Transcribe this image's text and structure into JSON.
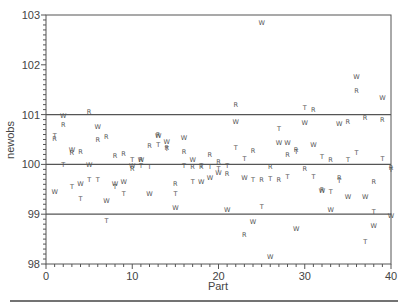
{
  "chart_data": {
    "type": "scatter",
    "title": "",
    "xlabel": "Part",
    "ylabel": "newobs",
    "xlim": [
      0,
      40
    ],
    "ylim": [
      98,
      103
    ],
    "x_ticks": [
      0,
      10,
      20,
      30,
      40
    ],
    "y_ticks": [
      98,
      99,
      100,
      101,
      102,
      103
    ],
    "reference_lines": [
      {
        "y": 101,
        "label": "upper limit"
      },
      {
        "y": 100,
        "label": "center"
      },
      {
        "y": 99,
        "label": "lower limit"
      }
    ],
    "grid": false,
    "legend": null,
    "marker_labels": [
      "R",
      "T",
      "W"
    ],
    "series": [
      {
        "name": "R",
        "points": [
          [
            1,
            100.52
          ],
          [
            2,
            100.8
          ],
          [
            3,
            100.23
          ],
          [
            4,
            100.25
          ],
          [
            5,
            101.06
          ],
          [
            6,
            100.5
          ],
          [
            7,
            100.57
          ],
          [
            8,
            100.18
          ],
          [
            9,
            100.21
          ],
          [
            10,
            99.92
          ],
          [
            11,
            100.1
          ],
          [
            12,
            100.37
          ],
          [
            13,
            100.6
          ],
          [
            14,
            100.34
          ],
          [
            15,
            99.62
          ],
          [
            16,
            100.26
          ],
          [
            17,
            99.96
          ],
          [
            18,
            99.96
          ],
          [
            19,
            100.19
          ],
          [
            20,
            100.05
          ],
          [
            21,
            99.82
          ],
          [
            22,
            101.2
          ],
          [
            23,
            98.6
          ],
          [
            24,
            100.27
          ],
          [
            25,
            99.7
          ],
          [
            26,
            99.96
          ],
          [
            27,
            99.7
          ],
          [
            28,
            100.2
          ],
          [
            29,
            100.3
          ],
          [
            30,
            99.92
          ],
          [
            31,
            101.1
          ],
          [
            32,
            99.5
          ],
          [
            33,
            100.1
          ],
          [
            34,
            99.74
          ],
          [
            35,
            100.86
          ],
          [
            36,
            101.48
          ],
          [
            37,
            100.95
          ],
          [
            38,
            99.65
          ],
          [
            39,
            100.91
          ],
          [
            40,
            99.93
          ]
        ]
      },
      {
        "name": "T",
        "points": [
          [
            1,
            100.59
          ],
          [
            2,
            100.0
          ],
          [
            3,
            99.56
          ],
          [
            4,
            99.32
          ],
          [
            5,
            99.7
          ],
          [
            6,
            99.7
          ],
          [
            7,
            98.88
          ],
          [
            8,
            99.56
          ],
          [
            9,
            99.42
          ],
          [
            10,
            100.1
          ],
          [
            11,
            99.97
          ],
          [
            12,
            99.95
          ],
          [
            13,
            100.4
          ],
          [
            14,
            100.32
          ],
          [
            15,
            99.42
          ],
          [
            16,
            99.97
          ],
          [
            17,
            99.65
          ],
          [
            18,
            99.97
          ],
          [
            19,
            99.95
          ],
          [
            20,
            99.92
          ],
          [
            21,
            99.98
          ],
          [
            22,
            100.33
          ],
          [
            23,
            100.12
          ],
          [
            24,
            99.7
          ],
          [
            25,
            99.15
          ],
          [
            26,
            99.72
          ],
          [
            27,
            100.72
          ],
          [
            28,
            99.75
          ],
          [
            29,
            100.26
          ],
          [
            30,
            101.14
          ],
          [
            31,
            99.75
          ],
          [
            32,
            100.16
          ],
          [
            33,
            99.45
          ],
          [
            34,
            99.67
          ],
          [
            35,
            100.1
          ],
          [
            36,
            100.23
          ],
          [
            37,
            98.45
          ],
          [
            38,
            99.05
          ],
          [
            39,
            100.12
          ],
          [
            40,
            99.9
          ]
        ]
      },
      {
        "name": "W",
        "points": [
          [
            1,
            99.46
          ],
          [
            2,
            100.98
          ],
          [
            3,
            100.3
          ],
          [
            4,
            99.62
          ],
          [
            5,
            99.99
          ],
          [
            6,
            100.76
          ],
          [
            7,
            99.28
          ],
          [
            8,
            99.61
          ],
          [
            9,
            99.65
          ],
          [
            10,
            99.98
          ],
          [
            11,
            100.1
          ],
          [
            12,
            99.42
          ],
          [
            13,
            100.58
          ],
          [
            14,
            100.45
          ],
          [
            15,
            99.14
          ],
          [
            16,
            100.55
          ],
          [
            17,
            100.1
          ],
          [
            18,
            99.65
          ],
          [
            19,
            99.74
          ],
          [
            20,
            99.83
          ],
          [
            21,
            99.09
          ],
          [
            22,
            100.87
          ],
          [
            23,
            99.73
          ],
          [
            24,
            98.85
          ],
          [
            25,
            102.85
          ],
          [
            26,
            98.15
          ],
          [
            27,
            100.43
          ],
          [
            28,
            100.43
          ],
          [
            29,
            98.71
          ],
          [
            30,
            100.85
          ],
          [
            31,
            100.4
          ],
          [
            32,
            99.48
          ],
          [
            33,
            99.09
          ],
          [
            34,
            100.82
          ],
          [
            35,
            99.35
          ],
          [
            36,
            101.77
          ],
          [
            37,
            99.35
          ],
          [
            38,
            98.77
          ],
          [
            39,
            101.34
          ],
          [
            40,
            98.98
          ]
        ]
      }
    ]
  },
  "axes": {
    "xlabel": "Part",
    "ylabel": "newobs",
    "x_tick_labels": [
      "0",
      "10",
      "20",
      "30",
      "40"
    ],
    "y_tick_labels": [
      "98",
      "99",
      "100",
      "101",
      "102",
      "103"
    ]
  },
  "style": {
    "line_color": "#555555",
    "marker_color": "#555555",
    "background": "#ffffff"
  }
}
